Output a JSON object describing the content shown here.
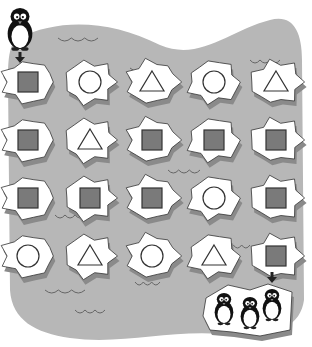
{
  "puzzle": {
    "type": "maze-path",
    "start_label": "penguin",
    "end_label": "penguin-family",
    "colors": {
      "water": "#b7b7b7",
      "ice": "#ffffff",
      "ice_shadow": "#8a8a8a",
      "outline": "#333333",
      "square_fill": "#7a7a7a",
      "wave": "#666666",
      "arrow": "#222222"
    },
    "grid": {
      "rows": 4,
      "cols": 5,
      "cells": [
        [
          "square",
          "circle",
          "triangle",
          "circle",
          "triangle"
        ],
        [
          "square",
          "triangle",
          "square",
          "square",
          "square"
        ],
        [
          "square",
          "square",
          "square",
          "circle",
          "square"
        ],
        [
          "circle",
          "triangle",
          "circle",
          "triangle",
          "square"
        ]
      ]
    },
    "start_arrow": "arrow-down",
    "end_arrow": "arrow-down",
    "end_penguin_count": 3
  }
}
